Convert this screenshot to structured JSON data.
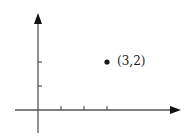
{
  "chart_data": {
    "type": "scatter",
    "title": "",
    "xlabel": "",
    "ylabel": "",
    "x": [
      3
    ],
    "y": [
      2
    ],
    "points": [
      {
        "x": 3,
        "y": 2,
        "label": "(3,2)"
      }
    ],
    "x_ticks": [
      1,
      2,
      3
    ],
    "y_ticks": [
      1,
      2
    ],
    "xlim": [
      -1,
      6.1
    ],
    "ylim": [
      -1,
      4
    ],
    "grid": false,
    "legend": null,
    "axes_arrows": true
  },
  "colors": {
    "axis": "#555555",
    "point": "#1a1a1a",
    "text": "#1a1a1a"
  }
}
